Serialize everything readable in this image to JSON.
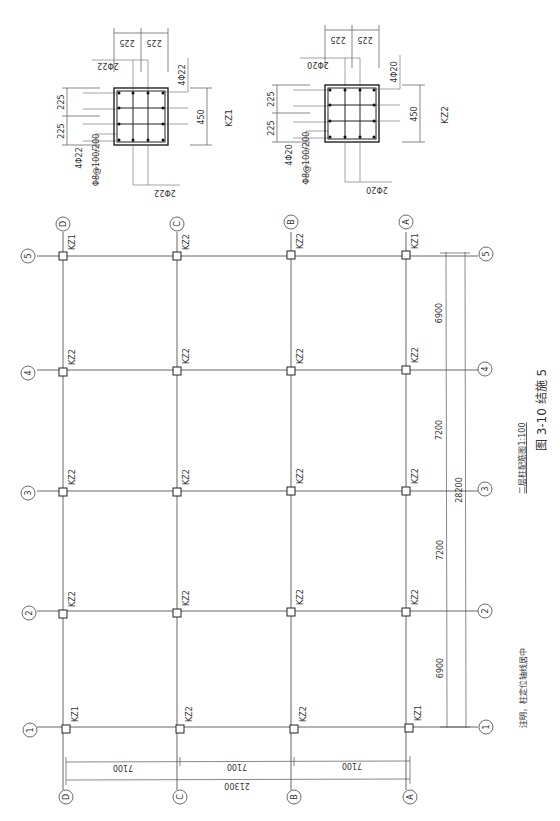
{
  "figure": {
    "caption": "图 3-10   结施 5",
    "plan_title": "二层柱配筋图1:100",
    "note": "注明，柱定位轴线居中"
  },
  "axes": {
    "letters": [
      "D",
      "C",
      "B",
      "A"
    ],
    "numbers": [
      "5",
      "4",
      "3",
      "2",
      "1"
    ]
  },
  "columns": {
    "row5": [
      "KZ1",
      "KZ2",
      "KZ2",
      "KZ1"
    ],
    "row4": [
      "KZ2",
      "KZ2",
      "KZ2",
      "KZ2"
    ],
    "row3": [
      "KZ2",
      "KZ2",
      "KZ2",
      "KZ2"
    ],
    "row2": [
      "KZ2",
      "KZ2",
      "KZ2",
      "KZ2"
    ],
    "row1": [
      "KZ1",
      "KZ2",
      "KZ2",
      "KZ1"
    ]
  },
  "dimensions": {
    "bays_letters": [
      "7100",
      "7100",
      "7100"
    ],
    "total_letters": "21300",
    "bays_numbers": [
      "6900",
      "7200",
      "7200",
      "6900"
    ],
    "total_numbers": "28200"
  },
  "sections": {
    "kz1": {
      "name": "KZ1",
      "size": "450",
      "half_a": "225",
      "half_b": "225",
      "corner_bars": "4Φ22",
      "side_bars_1": "2Φ22",
      "side_bars_2": "2Φ22",
      "side_bars_3": "4Φ22",
      "stirrup": "Φ8@100/200"
    },
    "kz2": {
      "name": "KZ2",
      "size": "450",
      "half_a": "225",
      "half_b": "225",
      "corner_bars": "4Φ20",
      "side_bars_1": "2Φ20",
      "side_bars_2": "2Φ20",
      "side_bars_3": "4Φ20",
      "stirrup": "Φ8@100/200"
    }
  }
}
